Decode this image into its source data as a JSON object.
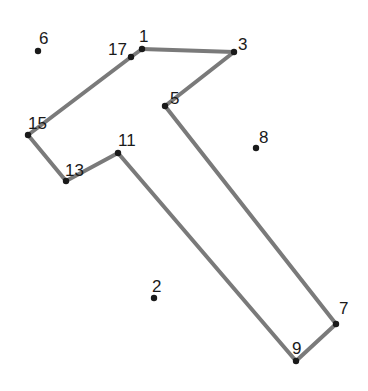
{
  "puzzle": {
    "type": "connect-the-dots",
    "line_color": "#7a7a7a",
    "dot_color": "#1a1a1a",
    "points": [
      {
        "label": "1",
        "x": 142,
        "y": 49,
        "lx": 139,
        "ly": 42
      },
      {
        "label": "2",
        "x": 154,
        "y": 298,
        "lx": 152,
        "ly": 292
      },
      {
        "label": "3",
        "x": 234,
        "y": 52,
        "lx": 238,
        "ly": 50
      },
      {
        "label": "5",
        "x": 165,
        "y": 106,
        "lx": 170,
        "ly": 104
      },
      {
        "label": "6",
        "x": 38,
        "y": 51,
        "lx": 39,
        "ly": 44
      },
      {
        "label": "7",
        "x": 336,
        "y": 324,
        "lx": 339,
        "ly": 314
      },
      {
        "label": "8",
        "x": 256,
        "y": 148,
        "lx": 259,
        "ly": 143
      },
      {
        "label": "9",
        "x": 296,
        "y": 361,
        "lx": 292,
        "ly": 354
      },
      {
        "label": "11",
        "x": 118,
        "y": 153,
        "lx": 118,
        "ly": 146
      },
      {
        "label": "13",
        "x": 66,
        "y": 181,
        "lx": 65,
        "ly": 176
      },
      {
        "label": "15",
        "x": 28,
        "y": 135,
        "lx": 28,
        "ly": 129
      },
      {
        "label": "17",
        "x": 131,
        "y": 57,
        "lx": 108,
        "ly": 55
      }
    ],
    "path": [
      [
        142,
        49
      ],
      [
        234,
        52
      ],
      [
        165,
        106
      ],
      [
        296,
        361
      ],
      [
        336,
        324
      ],
      [
        165,
        106
      ]
    ],
    "segments": [
      [
        [
          142,
          49
        ],
        [
          234,
          52
        ]
      ],
      [
        [
          234,
          52
        ],
        [
          165,
          106
        ]
      ],
      [
        [
          165,
          106
        ],
        [
          336,
          324
        ]
      ],
      [
        [
          336,
          324
        ],
        [
          296,
          361
        ]
      ],
      [
        [
          296,
          361
        ],
        [
          118,
          153
        ]
      ],
      [
        [
          118,
          153
        ],
        [
          66,
          181
        ]
      ],
      [
        [
          66,
          181
        ],
        [
          28,
          135
        ]
      ],
      [
        [
          28,
          135
        ],
        [
          131,
          57
        ]
      ],
      [
        [
          131,
          57
        ],
        [
          142,
          49
        ]
      ]
    ]
  }
}
